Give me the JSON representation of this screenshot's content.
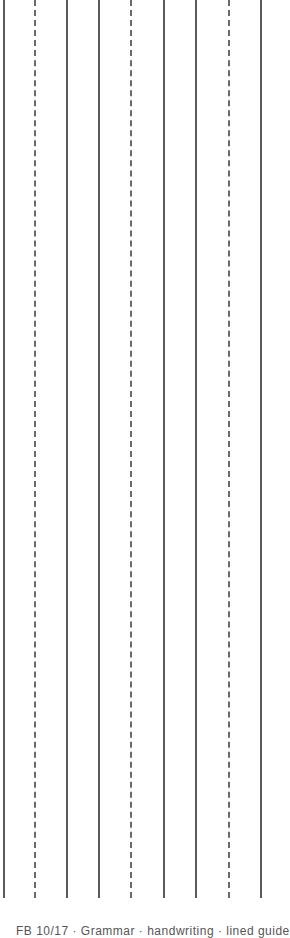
{
  "page": {
    "background": "#ffffff",
    "line_color_solid": "#5a5a5a",
    "line_color_dashed": "#6a6a6a"
  },
  "rules": [
    {
      "x": 3,
      "style": "solid"
    },
    {
      "x": 34,
      "style": "dashed"
    },
    {
      "x": 66,
      "style": "solid"
    },
    {
      "x": 98,
      "style": "solid"
    },
    {
      "x": 130,
      "style": "dashed"
    },
    {
      "x": 163,
      "style": "solid"
    },
    {
      "x": 195,
      "style": "solid"
    },
    {
      "x": 228,
      "style": "dashed"
    },
    {
      "x": 260,
      "style": "solid"
    }
  ],
  "footer": {
    "text": "FB 10/17 · Grammar · handwriting · lined guide"
  }
}
